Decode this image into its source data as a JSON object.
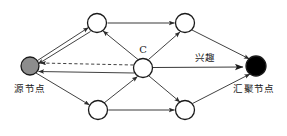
{
  "figure": {
    "title": "",
    "background_color": "#ffffff",
    "width": 287,
    "height": 136
  },
  "colors": {
    "source_node_fill": "#8d8d8d",
    "sink_node_fill": "#000000",
    "relay_node_fill": "#ffffff",
    "node_stroke": "#1a1a1a",
    "edge_stroke": "#2b2b2b",
    "text": "#1a1a1a"
  },
  "labels": {
    "source": "源节点",
    "sink": "汇聚节点",
    "interest": "兴趣",
    "center": "C"
  },
  "nodes": [
    {
      "id": "source",
      "label": "源节点",
      "x": 30,
      "y": 66,
      "r": 9,
      "fill": "#8d8d8d",
      "kind": "source"
    },
    {
      "id": "top-left",
      "label": "",
      "x": 97,
      "y": 23,
      "r": 9.5,
      "fill": "#ffffff",
      "kind": "relay"
    },
    {
      "id": "top-right",
      "label": "",
      "x": 185,
      "y": 23,
      "r": 9.5,
      "fill": "#ffffff",
      "kind": "relay"
    },
    {
      "id": "center",
      "label": "C",
      "x": 143,
      "y": 68,
      "r": 9.5,
      "fill": "#ffffff",
      "kind": "relay"
    },
    {
      "id": "bottom-left",
      "label": "",
      "x": 98,
      "y": 110,
      "r": 9.5,
      "fill": "#ffffff",
      "kind": "relay"
    },
    {
      "id": "bottom-right",
      "label": "",
      "x": 185,
      "y": 110,
      "r": 9.5,
      "fill": "#ffffff",
      "kind": "relay"
    },
    {
      "id": "sink",
      "label": "汇聚节点",
      "x": 256,
      "y": 66,
      "r": 10,
      "fill": "#000000",
      "kind": "sink"
    }
  ],
  "edges": [
    {
      "id": "e1",
      "from": "source",
      "to": "top-left",
      "style": "solid",
      "arrow": "to-target"
    },
    {
      "id": "e2",
      "from": "top-left",
      "to": "source",
      "style": "solid",
      "arrow": "to-target"
    },
    {
      "id": "e3",
      "from": "center",
      "to": "source",
      "style": "dashed",
      "arrow": "to-target"
    },
    {
      "id": "e4",
      "from": "center",
      "to": "source",
      "style": "solid",
      "arrow": "to-target"
    },
    {
      "id": "e5",
      "from": "center",
      "to": "top-left",
      "style": "solid",
      "arrow": "to-target"
    },
    {
      "id": "e6",
      "from": "top-right",
      "to": "top-left",
      "style": "solid",
      "arrow": "both"
    },
    {
      "id": "e7",
      "from": "center",
      "to": "top-right",
      "style": "solid",
      "arrow": "to-target"
    },
    {
      "id": "e8",
      "from": "top-right",
      "to": "sink",
      "style": "solid",
      "arrow": "to-target"
    },
    {
      "id": "e9",
      "from": "center",
      "to": "sink",
      "style": "solid",
      "arrow": "to-target",
      "label": "兴趣"
    },
    {
      "id": "e10",
      "from": "source",
      "to": "bottom-left",
      "style": "solid",
      "arrow": "to-target"
    },
    {
      "id": "e11",
      "from": "bottom-left",
      "to": "center",
      "style": "solid",
      "arrow": "to-target"
    },
    {
      "id": "e12",
      "from": "center",
      "to": "bottom-right",
      "style": "solid",
      "arrow": "to-target"
    },
    {
      "id": "e13",
      "from": "bottom-right",
      "to": "bottom-left",
      "style": "solid",
      "arrow": "both"
    },
    {
      "id": "e14",
      "from": "bottom-right",
      "to": "sink",
      "style": "solid",
      "arrow": "to-target"
    }
  ]
}
